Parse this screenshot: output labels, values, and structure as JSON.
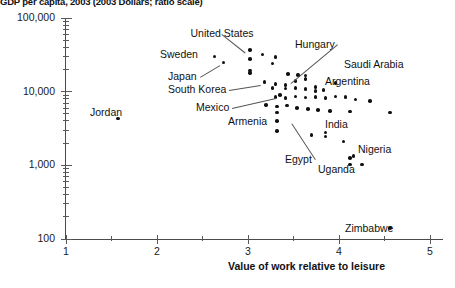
{
  "chart_data": {
    "type": "scatter",
    "title": "GDP per capita, 2003 (2003 Dollars; ratio scale)",
    "xlabel": "Value of work relative to leisure",
    "ylabel": "GDP per capita, 2003 (2003 Dollars; ratio scale)",
    "xlim": [
      1,
      5
    ],
    "ylim": [
      100,
      100000
    ],
    "yscale": "log",
    "xscale": "linear",
    "grid": false,
    "legend": "none",
    "xticks": [
      "1",
      "2",
      "3",
      "4",
      "5"
    ],
    "yticks": [
      "100",
      "1,000",
      "10,000",
      "100,000"
    ],
    "xtick_values": [
      1,
      2,
      3,
      4,
      5
    ],
    "ytick_values": [
      100,
      1000,
      10000,
      100000
    ],
    "minor_xticks": [
      1.5,
      2.5,
      3.5,
      4.5
    ],
    "annotations": [
      {
        "label": "United States",
        "x": 3.02,
        "y": 37000,
        "lx": 222,
        "ly": 27,
        "anchor": "center",
        "leader": true
      },
      {
        "label": "Sweden",
        "x": 2.63,
        "y": 30000,
        "lx": 160,
        "ly": 48,
        "anchor": "left",
        "leader": false
      },
      {
        "label": "Japan",
        "x": 2.73,
        "y": 25000,
        "lx": 168,
        "ly": 70,
        "anchor": "left",
        "leader": true
      },
      {
        "label": "South Korea",
        "x": 3.18,
        "y": 13500,
        "lx": 168,
        "ly": 83,
        "anchor": "left",
        "leader": true
      },
      {
        "label": "Hungary",
        "x": 3.52,
        "y": 14000,
        "lx": 295,
        "ly": 38,
        "anchor": "left",
        "leader": true
      },
      {
        "label": "Saudi Arabia",
        "x": 3.96,
        "y": 13000,
        "lx": 344,
        "ly": 58,
        "anchor": "left",
        "leader": false
      },
      {
        "label": "Argentina",
        "x": 3.83,
        "y": 10500,
        "lx": 325,
        "ly": 75,
        "anchor": "left",
        "leader": false
      },
      {
        "label": "Mexico",
        "x": 3.35,
        "y": 9000,
        "lx": 196,
        "ly": 101,
        "anchor": "left",
        "leader": true
      },
      {
        "label": "Armenia",
        "x": 3.32,
        "y": 4000,
        "lx": 228,
        "ly": 115,
        "anchor": "left",
        "leader": false
      },
      {
        "label": "Jordan",
        "x": 1.57,
        "y": 4300,
        "lx": 90,
        "ly": 106,
        "anchor": "left",
        "leader": false
      },
      {
        "label": "Egypt",
        "x": 3.52,
        "y": 4000,
        "lx": 285,
        "ly": 153,
        "anchor": "left",
        "leader": true
      },
      {
        "label": "India",
        "x": 3.85,
        "y": 2800,
        "lx": 325,
        "ly": 118,
        "anchor": "left",
        "leader": false
      },
      {
        "label": "Nigeria",
        "x": 4.16,
        "y": 1350,
        "lx": 358,
        "ly": 143,
        "anchor": "left",
        "leader": false
      },
      {
        "label": "Uganda",
        "x": 4.34,
        "y": 1050,
        "lx": 318,
        "ly": 163,
        "anchor": "left",
        "leader": false
      },
      {
        "label": "Zimbabwe",
        "x": 4.56,
        "y": 140,
        "lx": 345,
        "ly": 222,
        "anchor": "left",
        "leader": false
      }
    ],
    "points": [
      {
        "x": 2.63,
        "y": 30000
      },
      {
        "x": 2.73,
        "y": 25000
      },
      {
        "x": 1.57,
        "y": 4300
      },
      {
        "x": 3.02,
        "y": 37000
      },
      {
        "x": 3.02,
        "y": 28000
      },
      {
        "x": 3.16,
        "y": 32000
      },
      {
        "x": 3.3,
        "y": 29500
      },
      {
        "x": 3.27,
        "y": 24000
      },
      {
        "x": 3.02,
        "y": 19500
      },
      {
        "x": 3.02,
        "y": 18000
      },
      {
        "x": 3.18,
        "y": 13500
      },
      {
        "x": 3.44,
        "y": 17500
      },
      {
        "x": 3.55,
        "y": 16800
      },
      {
        "x": 3.63,
        "y": 16500
      },
      {
        "x": 3.63,
        "y": 14800
      },
      {
        "x": 3.52,
        "y": 14000
      },
      {
        "x": 3.3,
        "y": 12800
      },
      {
        "x": 3.41,
        "y": 12400
      },
      {
        "x": 3.27,
        "y": 11200
      },
      {
        "x": 3.41,
        "y": 11000
      },
      {
        "x": 3.52,
        "y": 11200
      },
      {
        "x": 3.63,
        "y": 10800
      },
      {
        "x": 3.74,
        "y": 11500
      },
      {
        "x": 3.74,
        "y": 10200
      },
      {
        "x": 3.96,
        "y": 13000
      },
      {
        "x": 3.83,
        "y": 10500
      },
      {
        "x": 3.35,
        "y": 9000
      },
      {
        "x": 3.3,
        "y": 8400
      },
      {
        "x": 3.41,
        "y": 8200
      },
      {
        "x": 3.52,
        "y": 8600
      },
      {
        "x": 3.63,
        "y": 8300
      },
      {
        "x": 3.74,
        "y": 8400
      },
      {
        "x": 3.85,
        "y": 8200
      },
      {
        "x": 3.96,
        "y": 8600
      },
      {
        "x": 4.07,
        "y": 8400
      },
      {
        "x": 4.18,
        "y": 7800
      },
      {
        "x": 4.34,
        "y": 7400
      },
      {
        "x": 3.2,
        "y": 6600
      },
      {
        "x": 3.32,
        "y": 6300
      },
      {
        "x": 3.43,
        "y": 6500
      },
      {
        "x": 3.32,
        "y": 5200
      },
      {
        "x": 3.54,
        "y": 6000
      },
      {
        "x": 3.66,
        "y": 5800
      },
      {
        "x": 3.77,
        "y": 5600
      },
      {
        "x": 3.9,
        "y": 5500
      },
      {
        "x": 4.12,
        "y": 5400
      },
      {
        "x": 4.56,
        "y": 5200
      },
      {
        "x": 3.32,
        "y": 4000
      },
      {
        "x": 3.32,
        "y": 2900
      },
      {
        "x": 3.7,
        "y": 2600
      },
      {
        "x": 3.85,
        "y": 2800
      },
      {
        "x": 3.85,
        "y": 2450
      },
      {
        "x": 4.05,
        "y": 2100
      },
      {
        "x": 4.16,
        "y": 1350
      },
      {
        "x": 4.12,
        "y": 1250
      },
      {
        "x": 4.12,
        "y": 1020
      },
      {
        "x": 4.25,
        "y": 1020
      },
      {
        "x": 4.56,
        "y": 140
      }
    ]
  }
}
